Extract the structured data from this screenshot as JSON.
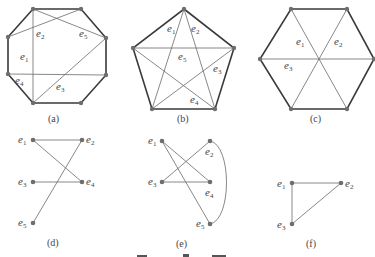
{
  "figure": {
    "panels": [
      {
        "id": "a",
        "caption": "(a)",
        "shape": "octagon",
        "edge_labels": [
          "e1",
          "e2",
          "e3",
          "e4",
          "e5"
        ]
      },
      {
        "id": "b",
        "caption": "(b)",
        "shape": "pentagon",
        "edge_labels": [
          "e1",
          "e2",
          "e3",
          "e4",
          "e5"
        ]
      },
      {
        "id": "c",
        "caption": "(c)",
        "shape": "hexagon",
        "edge_labels": [
          "e1",
          "e2",
          "e3"
        ]
      },
      {
        "id": "d",
        "caption": "(d)",
        "shape": "conflict-graph",
        "vertex_labels": [
          "e1",
          "e2",
          "e3",
          "e4",
          "e5"
        ]
      },
      {
        "id": "e",
        "caption": "(e)",
        "shape": "conflict-graph",
        "vertex_labels": [
          "e1",
          "e2",
          "e3",
          "e4",
          "e5"
        ]
      },
      {
        "id": "f",
        "caption": "(f)",
        "shape": "conflict-graph",
        "vertex_labels": [
          "e1",
          "e2",
          "e3"
        ]
      }
    ],
    "labels": {
      "a": {
        "caption": "(a)",
        "e1": "e",
        "e1s": "1",
        "e2": "e",
        "e2s": "2",
        "e3": "e",
        "e3s": "3",
        "e4": "e",
        "e4s": "4",
        "e5": "e",
        "e5s": "5"
      },
      "b": {
        "caption": "(b)",
        "e1": "e",
        "e1s": "1",
        "e2": "e",
        "e2s": "2",
        "e3": "e",
        "e3s": "3",
        "e4": "e",
        "e4s": "4",
        "e5": "e",
        "e5s": "5"
      },
      "c": {
        "caption": "(c)",
        "e1": "e",
        "e1s": "1",
        "e2": "e",
        "e2s": "2",
        "e3": "e",
        "e3s": "3"
      },
      "d": {
        "caption": "(d)",
        "e1": "e",
        "e1s": "1",
        "e2": "e",
        "e2s": "2",
        "e3": "e",
        "e3s": "3",
        "e4": "e",
        "e4s": "4",
        "e5": "e",
        "e5s": "5"
      },
      "e": {
        "caption": "(e)",
        "e1": "e",
        "e1s": "1",
        "e2": "e",
        "e2s": "2",
        "e3": "e",
        "e3s": "3",
        "e4": "e",
        "e4s": "4",
        "e5": "e",
        "e5s": "5"
      },
      "f": {
        "caption": "(f)",
        "e1": "e",
        "e1s": "1",
        "e2": "e",
        "e2s": "2",
        "e3": "e",
        "e3s": "3"
      }
    }
  }
}
